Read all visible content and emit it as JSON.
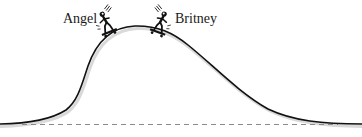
{
  "diagram": {
    "labels": {
      "left_skater": "Angel",
      "right_skater": "Britney"
    },
    "elements": {
      "hill_curve": "hill-shaped curve (track)",
      "baseline": "dashed horizontal reference line",
      "skaters": [
        "Angel",
        "Britney"
      ]
    },
    "colors": {
      "curve": "#111111",
      "baseline": "#8a8a8a",
      "shadow": "#d9d9d9",
      "background": "#ffffff"
    }
  }
}
